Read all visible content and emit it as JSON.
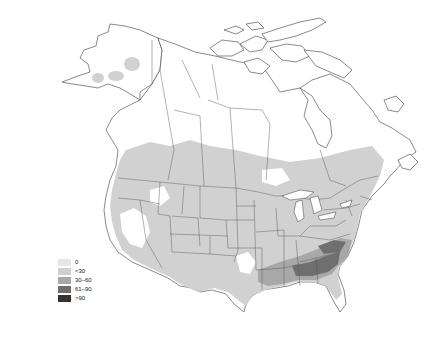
{
  "map": {
    "region": "North America",
    "colors": {
      "background": "#ffffff",
      "outline": "#3a3a3a",
      "bin0": "#e6e6e6",
      "bin1": "#cfcfcf",
      "bin2": "#a8a8a8",
      "bin3": "#6f6f6f",
      "bin4": "#333333"
    }
  },
  "legend": {
    "items": [
      {
        "label": "0",
        "color": "#e6e6e6"
      },
      {
        "label": "<30",
        "color": "#cfcfcf"
      },
      {
        "label": "30–60",
        "color": "#a8a8a8"
      },
      {
        "label": "61–90",
        "color": "#6f6f6f"
      },
      {
        "label": ">90",
        "color": "#333333"
      }
    ]
  }
}
